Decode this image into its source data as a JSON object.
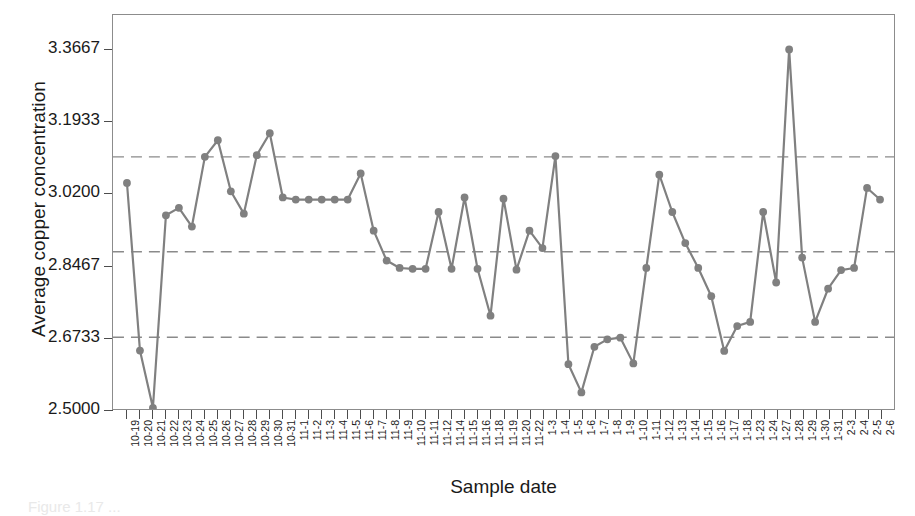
{
  "axes": {
    "ylabel": "Average copper concentration",
    "xlabel": "Sample date",
    "ytick_labels": [
      "3.3667",
      "3.1933",
      "3.0200",
      "2.8467",
      "2.6733",
      "2.5000"
    ]
  },
  "caption": "Figure 1.17 ...",
  "style": {
    "line_color": "#808080",
    "marker_color": "#808080",
    "limit_line_color": "#8a8a8a",
    "frame_color": "#8c8c8c",
    "text_color": "#1a1a1a"
  },
  "chart_data": {
    "type": "line",
    "title": "",
    "xlabel": "Sample date",
    "ylabel": "Average copper concentration",
    "ylim": [
      2.5,
      3.45
    ],
    "ytick_values": [
      3.3667,
      3.1933,
      3.02,
      2.8467,
      2.6733,
      2.5
    ],
    "grid": false,
    "legend": null,
    "control_lines": {
      "upper_control_limit": 3.108,
      "center_line": 2.879,
      "lower_control_limit": 2.673,
      "style": "dashed"
    },
    "categories": [
      "10-19",
      "10-20",
      "10-21",
      "10-22",
      "10-23",
      "10-24",
      "10-25",
      "10-26",
      "10-27",
      "10-28",
      "10-29",
      "10-30",
      "10-31",
      "11-1",
      "11-2",
      "11-3",
      "11-4",
      "11-5",
      "11-6",
      "11-7",
      "11-8",
      "11-9",
      "11-10",
      "11-11",
      "11-12",
      "11-14",
      "11-15",
      "11-16",
      "11-18",
      "11-19",
      "11-20",
      "11-22",
      "1-3",
      "1-4",
      "1-5",
      "1-6",
      "1-7",
      "1-8",
      "1-9",
      "1-10",
      "1-11",
      "1-12",
      "1-13",
      "1-14",
      "1-15",
      "1-16",
      "1-17",
      "1-18",
      "1-23",
      "1-24",
      "1-27",
      "1-28",
      "1-29",
      "1-30",
      "1-31",
      "2-3",
      "2-4",
      "2-5",
      "2-6"
    ],
    "values": [
      3.045,
      2.641,
      2.503,
      2.967,
      2.985,
      2.94,
      3.108,
      3.148,
      3.025,
      2.971,
      3.112,
      3.165,
      3.01,
      3.005,
      3.005,
      3.005,
      3.005,
      3.005,
      3.068,
      2.93,
      2.858,
      2.84,
      2.838,
      2.838,
      2.975,
      2.838,
      3.01,
      2.838,
      2.725,
      3.007,
      2.836,
      2.93,
      2.888,
      3.11,
      2.608,
      2.54,
      2.65,
      2.668,
      2.672,
      2.61,
      2.84,
      3.065,
      2.975,
      2.9,
      2.84,
      2.772,
      2.64,
      2.7,
      2.71,
      2.975,
      2.805,
      3.367,
      2.865,
      2.71,
      2.79,
      2.835,
      2.84,
      3.033,
      3.005
    ]
  }
}
